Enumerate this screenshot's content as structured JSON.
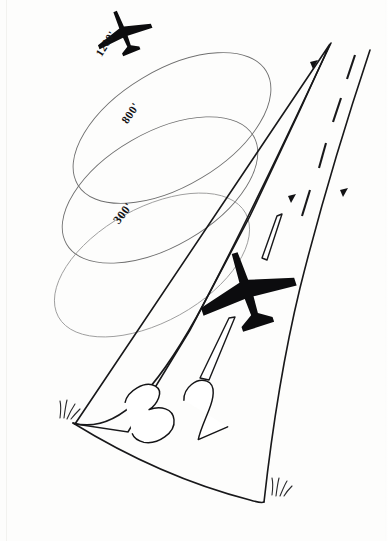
{
  "diagram": {
    "medium": "hand-drawn pen sketch on white paper",
    "background_color": "#fdfdfc",
    "ink_color": "#18181a",
    "pattern_line_color": "#6f6f6f"
  },
  "runway": {
    "designator_label": "32",
    "designator_digits": [
      "3",
      "2"
    ],
    "edge_color": "#18181a",
    "centerline_dash_count": 5,
    "direction_arrow_count": 3
  },
  "altitude_labels": [
    {
      "id": "alt-1200",
      "text": "1200'",
      "value": 1200,
      "unit": "feet",
      "order": 1
    },
    {
      "id": "alt-800",
      "text": "800'",
      "value": 800,
      "unit": "feet",
      "order": 2
    },
    {
      "id": "alt-300",
      "text": "300'",
      "value": 300,
      "unit": "feet",
      "order": 3
    }
  ],
  "aircraft": [
    {
      "id": "aircraft-upper",
      "position": "top-left, entering pattern at 1200 feet"
    },
    {
      "id": "aircraft-lower",
      "position": "over runway threshold on final approach"
    }
  ],
  "pattern_loops": [
    {
      "id": "loop-1200",
      "altitude_text": "1200'"
    },
    {
      "id": "loop-800",
      "altitude_text": "800'"
    },
    {
      "id": "loop-300",
      "altitude_text": "300'"
    }
  ],
  "scenery": {
    "grass_tuft_left": "grass tuft at left runway threshold corner",
    "grass_tuft_right": "grass tuft at right runway edge near threshold"
  }
}
